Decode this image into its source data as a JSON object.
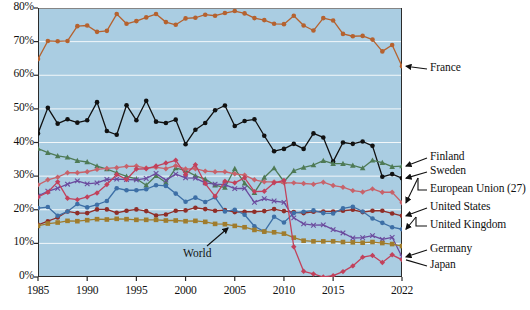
{
  "chart_data": {
    "type": "line",
    "title": "",
    "subtitle": "",
    "xlabel": "",
    "ylabel": "",
    "xlim": [
      1985,
      2022
    ],
    "ylim": [
      0,
      80
    ],
    "ytick_labels": [
      "0%",
      "10%",
      "20%",
      "30%",
      "40%",
      "50%",
      "60%",
      "70%",
      "80%"
    ],
    "ytick_values": [
      0,
      10,
      20,
      30,
      40,
      50,
      60,
      70,
      80
    ],
    "xtick_labels": [
      "1985",
      "1990",
      "1995",
      "2000",
      "2005",
      "2010",
      "2015",
      "2022"
    ],
    "xtick_values": [
      1985,
      1990,
      1995,
      2000,
      2005,
      2010,
      2015,
      2022
    ],
    "grid": "horizontal-white",
    "plot_background": "#aacde2",
    "legend_position": "right-of-axes-with-arrows",
    "annotations": [
      {
        "label": "World",
        "points_to_series": "World",
        "x": 2003,
        "y": 12.5
      }
    ],
    "x": [
      1985,
      1986,
      1987,
      1988,
      1989,
      1990,
      1991,
      1992,
      1993,
      1994,
      1995,
      1996,
      1997,
      1998,
      1999,
      2000,
      2001,
      2002,
      2003,
      2004,
      2005,
      2006,
      2007,
      2008,
      2009,
      2010,
      2011,
      2012,
      2013,
      2014,
      2015,
      2016,
      2017,
      2018,
      2019,
      2020,
      2021,
      2022
    ],
    "series": [
      {
        "name": "France",
        "color": "#b5622f",
        "marker": "circle",
        "label_y": 69,
        "values": [
          64.8,
          70.2,
          70.1,
          70.2,
          74.6,
          74.8,
          72.9,
          73.2,
          78.2,
          75.3,
          76.1,
          77.2,
          78.2,
          75.8,
          75.0,
          76.9,
          77.1,
          78.0,
          77.7,
          78.5,
          79.1,
          78.4,
          77.0,
          76.4,
          75.3,
          75.2,
          77.7,
          74.8,
          73.3,
          77.0,
          76.3,
          72.3,
          71.6,
          71.7,
          70.6,
          67.1,
          69.0,
          62.7
        ]
      },
      {
        "name": "Sweden",
        "color": "#111111",
        "marker": "circle",
        "label_y": 31.2,
        "values": [
          42.7,
          50.3,
          45.6,
          46.9,
          45.9,
          46.6,
          52.0,
          43.4,
          42.3,
          51.1,
          46.6,
          52.4,
          46.2,
          45.8,
          46.8,
          39.5,
          43.8,
          45.8,
          49.6,
          51.0,
          44.9,
          46.4,
          46.9,
          42.0,
          37.4,
          38.1,
          39.6,
          38.1,
          42.7,
          41.5,
          34.3,
          40.0,
          39.6,
          40.3,
          39.0,
          29.8,
          30.6,
          29.4
        ]
      },
      {
        "name": "Finland",
        "color": "#4e7a55",
        "marker": "triangle",
        "label_y": 34.5,
        "values": [
          38.2,
          37.0,
          36.0,
          35.6,
          34.6,
          34.2,
          33.0,
          32.1,
          31.0,
          29.9,
          29.2,
          27.3,
          30.1,
          28.1,
          32.4,
          31.7,
          30.1,
          29.1,
          27.3,
          26.6,
          32.2,
          27.9,
          25.1,
          29.6,
          32.4,
          28.4,
          31.6,
          32.6,
          33.3,
          34.6,
          33.7,
          33.7,
          33.2,
          32.4,
          34.7,
          34.0,
          32.8,
          33.0
        ]
      },
      {
        "name": "European Union (27)",
        "color": "#c8626a",
        "marker": "diamond",
        "label_y": 26.5,
        "values": [
          27.4,
          28.9,
          29.7,
          31.0,
          31.0,
          31.3,
          32.0,
          32.3,
          32.5,
          32.9,
          33.0,
          32.4,
          32.6,
          32.2,
          33.1,
          32.1,
          32.2,
          31.5,
          31.3,
          31.3,
          30.7,
          30.3,
          28.9,
          28.3,
          28.3,
          28.0,
          28.0,
          27.8,
          27.6,
          28.2,
          27.2,
          26.7,
          25.7,
          25.3,
          26.2,
          25.2,
          25.2,
          22.1
        ]
      },
      {
        "name": "United States",
        "color": "#8f2e28",
        "marker": "circle",
        "label_y": 19.6,
        "values": [
          15.5,
          16.6,
          17.7,
          19.5,
          19.0,
          19.0,
          20.1,
          20.1,
          19.1,
          19.7,
          20.1,
          19.6,
          18.3,
          18.6,
          19.7,
          19.8,
          20.6,
          20.2,
          19.7,
          19.9,
          19.3,
          19.4,
          19.4,
          19.6,
          20.2,
          19.6,
          19.3,
          19.0,
          19.4,
          19.5,
          19.5,
          19.7,
          20.0,
          19.3,
          19.7,
          19.7,
          18.9,
          18.2
        ]
      },
      {
        "name": "United Kingdom",
        "color": "#3d6fa6",
        "marker": "circle",
        "label_y": 16.1,
        "values": [
          20.5,
          20.8,
          18.2,
          19.5,
          21.7,
          20.7,
          21.5,
          22.6,
          26.4,
          25.8,
          25.8,
          26.1,
          27.3,
          27.1,
          24.8,
          22.4,
          23.6,
          22.3,
          23.7,
          19.5,
          20.0,
          18.5,
          15.1,
          13.5,
          17.9,
          16.2,
          19.0,
          19.4,
          19.8,
          19.0,
          18.9,
          20.4,
          20.9,
          19.5,
          17.4,
          16.1,
          14.8,
          14.2
        ]
      },
      {
        "name": "Germany",
        "color": "#6b4b9e",
        "marker": "x",
        "label_y": 11.0,
        "values": [
          24.1,
          25.5,
          26.4,
          27.6,
          28.6,
          27.7,
          28.0,
          29.0,
          29.1,
          29.0,
          28.9,
          29.3,
          30.8,
          28.8,
          30.6,
          29.5,
          29.4,
          28.0,
          27.6,
          27.5,
          26.3,
          26.4,
          22.2,
          23.3,
          22.6,
          22.2,
          17.6,
          15.8,
          15.4,
          15.5,
          14.1,
          13.1,
          11.6,
          11.7,
          12.3,
          11.2,
          11.8,
          6.0
        ]
      },
      {
        "name": "World",
        "color": "#a07c2c",
        "marker": "square",
        "label_y": 9.8,
        "values": [
          15.2,
          15.9,
          16.2,
          16.7,
          16.6,
          16.9,
          17.2,
          17.1,
          17.3,
          17.2,
          17.0,
          17.0,
          17.0,
          16.8,
          16.8,
          16.6,
          16.7,
          16.4,
          15.8,
          15.7,
          15.2,
          14.8,
          14.0,
          13.5,
          13.3,
          12.9,
          11.7,
          10.8,
          10.6,
          10.6,
          10.6,
          10.4,
          10.3,
          10.2,
          10.4,
          10.1,
          9.8,
          9.2
        ]
      },
      {
        "name": "Japan",
        "color": "#c2415b",
        "marker": "diamond",
        "label_y": 5.5,
        "values": [
          23.8,
          25.2,
          28.3,
          23.4,
          23.0,
          23.8,
          25.0,
          27.5,
          30.5,
          29.0,
          32.1,
          32.2,
          33.0,
          33.9,
          34.7,
          30.5,
          33.4,
          27.8,
          24.0,
          28.5,
          28.0,
          29.5,
          25.4,
          25.5,
          28.0,
          28.7,
          9.0,
          1.7,
          0.9,
          0.0,
          0.4,
          1.6,
          3.3,
          5.9,
          6.4,
          4.3,
          6.6,
          5.1
        ]
      }
    ],
    "legend_entries": [
      {
        "label": "France",
        "color": "#b5622f"
      },
      {
        "label": "Finland",
        "color": "#4e7a55"
      },
      {
        "label": "Sweden",
        "color": "#111111"
      },
      {
        "label": "European Union (27)",
        "color": "#c8626a"
      },
      {
        "label": "United States",
        "color": "#8f2e28"
      },
      {
        "label": "United Kingdom",
        "color": "#3d6fa6"
      },
      {
        "label": "Germany",
        "color": "#6b4b9e"
      },
      {
        "label": "Japan",
        "color": "#c2415b"
      }
    ]
  }
}
